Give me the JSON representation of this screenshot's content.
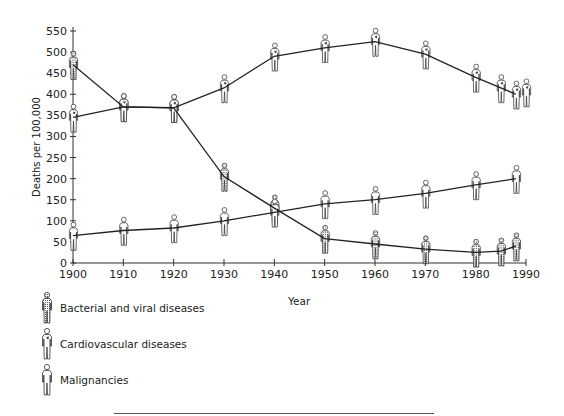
{
  "chart_data": {
    "type": "line",
    "title": "",
    "xlabel": "Year",
    "ylabel": "Deaths per 100,000",
    "xlim": [
      1900,
      1990
    ],
    "ylim": [
      0,
      550
    ],
    "x_ticks": [
      1900,
      1910,
      1920,
      1930,
      1940,
      1950,
      1960,
      1970,
      1980,
      1990
    ],
    "y_ticks": [
      0,
      50,
      100,
      150,
      200,
      250,
      300,
      350,
      400,
      450,
      500,
      550
    ],
    "grid": false,
    "legend_position": "bottom-left",
    "series": [
      {
        "name": "Bacterial and viral diseases",
        "marker": "shaded-figure",
        "x": [
          1900,
          1910,
          1920,
          1930,
          1940,
          1950,
          1960,
          1970,
          1980,
          1985,
          1988
        ],
        "values": [
          470,
          370,
          368,
          205,
          130,
          58,
          45,
          33,
          25,
          28,
          40
        ]
      },
      {
        "name": "Cardiovascular diseases",
        "marker": "heart-figure",
        "x": [
          1900,
          1910,
          1920,
          1930,
          1940,
          1950,
          1960,
          1970,
          1980,
          1985,
          1988
        ],
        "values": [
          345,
          370,
          368,
          415,
          490,
          510,
          525,
          495,
          440,
          415,
          400
        ]
      },
      {
        "name": "Malignancies",
        "marker": "outline-figure",
        "x": [
          1900,
          1910,
          1920,
          1930,
          1940,
          1950,
          1960,
          1970,
          1980,
          1988
        ],
        "values": [
          65,
          77,
          83,
          100,
          120,
          140,
          150,
          165,
          185,
          200
        ]
      }
    ]
  },
  "legend": {
    "items": [
      {
        "label": "Bacterial and viral diseases",
        "icon": "shaded-person-icon"
      },
      {
        "label": "Cardiovascular diseases",
        "icon": "heart-person-icon"
      },
      {
        "label": "Malignancies",
        "icon": "outline-person-icon"
      }
    ]
  },
  "axes": {
    "xlabel": "Year",
    "ylabel": "Deaths per 100,000"
  }
}
